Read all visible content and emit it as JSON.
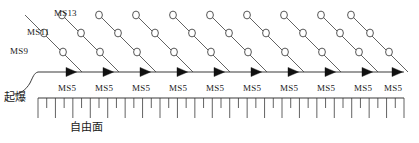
{
  "figure": {
    "type": "blasting-initiation-network-diagram",
    "background_color": "#ffffff",
    "line_color": "#3a3a3a",
    "text_color": "#1a1a1a"
  },
  "row_labels": [
    {
      "name": "ms13-row-label",
      "text": "MS13",
      "x": 54,
      "y": 9
    },
    {
      "name": "ms11-row-label",
      "text": "MS11",
      "x": 27,
      "y": 28
    },
    {
      "name": "ms9-row-label",
      "text": "MS9",
      "x": 10,
      "y": 47
    }
  ],
  "initiation": {
    "label": "起爆",
    "label_x": 4,
    "label_y": 92
  },
  "free_face": {
    "label": "自由面",
    "label_x": 70,
    "label_y": 122
  },
  "trunk_line": {
    "name": "main-detonating-cord",
    "x_start": 38,
    "x_end": 404,
    "y": 72
  },
  "delay_arrows": {
    "label": "MS5",
    "count": 10,
    "label_y": 84,
    "positions_x": [
      74,
      111,
      148,
      185,
      222,
      259,
      296,
      333,
      370,
      400
    ]
  },
  "hole_rows": [
    {
      "row": "MS13",
      "count": 9,
      "y": 15
    },
    {
      "row": "MS11",
      "count": 10,
      "y": 33
    },
    {
      "row": "MS9",
      "count": 10,
      "y": 52
    }
  ],
  "diagonal_lines": {
    "count": 10,
    "dx_per_row": 19,
    "dy_per_row": 19
  },
  "hatch": {
    "y_line": 98,
    "x_start": 38,
    "x_end": 404,
    "tick_count": 43,
    "long_tick_length": 20,
    "short_tick_length": 10
  },
  "ms5_labels": [
    "MS5",
    "MS5",
    "MS5",
    "MS5",
    "MS5",
    "MS5",
    "MS5",
    "MS5",
    "MS5",
    "MS5"
  ]
}
